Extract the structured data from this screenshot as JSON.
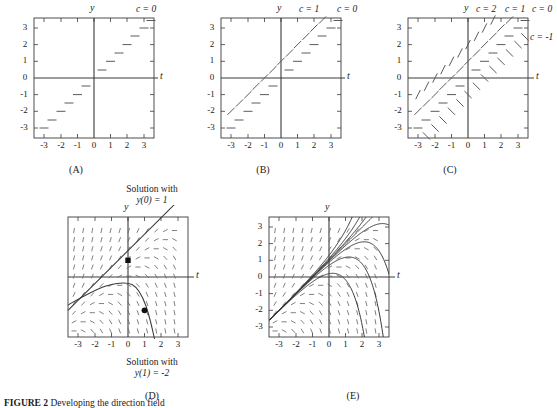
{
  "figure": {
    "caption_label": "FIGURE 2",
    "caption_body": "Developing the direction field"
  },
  "axes": {
    "x_label": "t",
    "y_label": "y",
    "x_ticks": [
      "-3",
      "-2",
      "-1",
      "0",
      "1",
      "2",
      "3"
    ],
    "y_ticks": [
      "3",
      "2",
      "1",
      "0",
      "-1",
      "-2",
      "-3"
    ],
    "x_min": -3.6,
    "x_max": 3.6,
    "y_min": -3.6,
    "y_max": 3.6
  },
  "panels": [
    {
      "id": "A",
      "caption": "(A)",
      "isocline_labels": [
        {
          "text": "c = 0",
          "position": "top-right"
        }
      ]
    },
    {
      "id": "B",
      "caption": "(B)",
      "isocline_labels": [
        {
          "text": "c = 1",
          "position": "top-mid"
        },
        {
          "text": "c = 0",
          "position": "top-right"
        }
      ]
    },
    {
      "id": "C",
      "caption": "(C)",
      "isocline_labels": [
        {
          "text": "c = 2",
          "position": "top-left"
        },
        {
          "text": "c = 1",
          "position": "top-mid"
        },
        {
          "text": "c = 0",
          "position": "top-right"
        },
        {
          "text": "c = -1",
          "position": "right-side"
        }
      ]
    },
    {
      "id": "D",
      "caption": "(D)",
      "notes": [
        {
          "line1": "Solution with",
          "line2": "y(0) = 1",
          "position": "top"
        },
        {
          "line1": "Solution with",
          "line2": "y(1) = -2",
          "position": "bottom"
        }
      ],
      "marked_points": [
        {
          "t": 0,
          "y": 1
        },
        {
          "t": 1,
          "y": -2
        }
      ]
    },
    {
      "id": "E",
      "caption": "(E)"
    }
  ],
  "chart_data": {
    "type": "line",
    "title": "Developing the direction field",
    "xlabel": "t",
    "ylabel": "y",
    "xlim": [
      -3.6,
      3.6
    ],
    "ylim": [
      -3.6,
      3.6
    ],
    "grid": false,
    "equation": "y' = y - t",
    "isoclines": [
      {
        "c": 0,
        "line": "y = t",
        "slope": 1,
        "intercept": 0,
        "dash_slope": 0
      },
      {
        "c": 1,
        "line": "y = t + 1",
        "slope": 1,
        "intercept": 1,
        "dash_slope": 1
      },
      {
        "c": 2,
        "line": "y = t + 2",
        "slope": 1,
        "intercept": 2,
        "dash_slope": 2
      },
      {
        "c": -1,
        "line": "y = t - 1",
        "slope": 1,
        "intercept": -1,
        "dash_slope": -1
      }
    ],
    "panel_isocline_sets": {
      "A": [
        0
      ],
      "B": [
        1,
        0
      ],
      "C": [
        2,
        1,
        0,
        -1
      ],
      "D": [],
      "E": []
    },
    "solutions": [
      {
        "name": "y(0) = 1",
        "type": "straight",
        "formula": "y = t + 1",
        "through": [
          0,
          1
        ]
      },
      {
        "name": "y(1) = -2",
        "type": "curved",
        "formula": "y = t + 1 - 4e^(t-1)",
        "through": [
          1,
          -2
        ]
      }
    ],
    "solution_family_E": [
      {
        "k": 0.0,
        "note": "separatrix y = t + 1"
      },
      {
        "k": -0.04,
        "note": "family member"
      },
      {
        "k": -0.12,
        "note": "family member"
      },
      {
        "k": -0.3,
        "note": "family member"
      },
      {
        "k": -0.8,
        "note": "family member"
      },
      {
        "k": 0.04,
        "note": "family member"
      },
      {
        "k": 0.12,
        "note": "family member"
      },
      {
        "k": 0.3,
        "note": "family member"
      }
    ]
  }
}
